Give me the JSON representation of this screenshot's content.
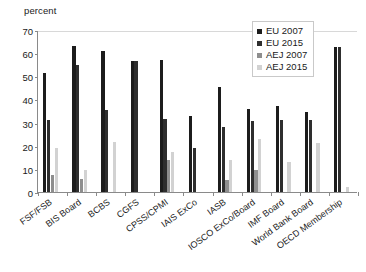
{
  "chart_data": {
    "type": "bar",
    "title": "",
    "subtitle": "",
    "xlabel": "",
    "ylabel": "percent",
    "ylim": [
      0,
      70
    ],
    "yticks": [
      0,
      10,
      20,
      30,
      40,
      50,
      60,
      70
    ],
    "grid": false,
    "legend_position": "top-right",
    "categories": [
      "FSF/FSB",
      "BIS Board",
      "BCBS",
      "CGFS",
      "CPSS/CPMI",
      "IAIS ExCo",
      "IASB",
      "IOSCO ExCo/Board",
      "IMF Board",
      "World Bank Board",
      "OECD Membership"
    ],
    "series": [
      {
        "name": "EU 2007",
        "color": "#1c1c1c",
        "values": [
          51.5,
          63.0,
          61.0,
          56.5,
          57.0,
          33.0,
          45.5,
          36.0,
          37.0,
          34.5,
          62.5
        ]
      },
      {
        "name": "EU 2015",
        "color": "#2e2e2e",
        "values": [
          31.0,
          55.0,
          35.5,
          56.5,
          31.5,
          19.0,
          28.0,
          30.5,
          31.0,
          31.0,
          62.5
        ]
      },
      {
        "name": "AEJ 2007",
        "color": "#8e8e8e",
        "values": [
          7.5,
          5.5,
          0.0,
          0.0,
          14.0,
          0.0,
          5.0,
          9.5,
          0.0,
          0.0,
          0.0
        ]
      },
      {
        "name": "AEJ 2015",
        "color": "#d2d2d2",
        "values": [
          19.0,
          9.5,
          21.5,
          0.0,
          17.5,
          0.0,
          14.0,
          23.0,
          13.0,
          21.0,
          2.0
        ]
      }
    ]
  },
  "legend": {
    "entries": [
      {
        "label": "EU 2007"
      },
      {
        "label": "EU 2015"
      },
      {
        "label": "AEJ 2007"
      },
      {
        "label": "AEJ 2015"
      }
    ]
  },
  "axes": {
    "y_title": "percent"
  }
}
